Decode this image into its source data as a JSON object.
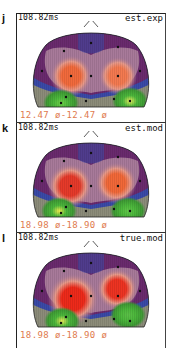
{
  "figure": {
    "panels": [
      {
        "letter": "j",
        "time": "108.82ms",
        "label": "est.exp",
        "scale": "12.47 ø-12.47 ø",
        "maxima": [
          {
            "x": 45,
            "y": 55,
            "color": "#f26a3c",
            "r": 13
          },
          {
            "x": 92,
            "y": 55,
            "color": "#f47a50",
            "r": 12
          }
        ],
        "greens": [
          {
            "x": 35,
            "y": 82,
            "highlight": "#6fd24a"
          },
          {
            "x": 104,
            "y": 80,
            "highlight": "#e8f060"
          }
        ]
      },
      {
        "letter": "k",
        "time": "108.82ms",
        "label": "est.mod",
        "scale": "18.98 ø-18.90 ø",
        "maxima": [
          {
            "x": 44,
            "y": 55,
            "color": "#e63a2a",
            "r": 14
          },
          {
            "x": 90,
            "y": 52,
            "color": "#f26838",
            "r": 13
          }
        ],
        "greens": [
          {
            "x": 33,
            "y": 80,
            "highlight": "#f0f050"
          },
          {
            "x": 102,
            "y": 80,
            "highlight": "#62c84a"
          }
        ]
      },
      {
        "letter": "l",
        "time": "108.82ms",
        "label": "true.mod",
        "scale": "18.98 ø-18.90 ø",
        "maxima": [
          {
            "x": 47,
            "y": 58,
            "color": "#ee2a1a",
            "r": 16
          },
          {
            "x": 91,
            "y": 48,
            "color": "#ee3322",
            "r": 13
          }
        ],
        "greens": [
          {
            "x": 36,
            "y": 80,
            "highlight": "#e8ec58"
          },
          {
            "x": 102,
            "y": 74,
            "highlight": "#5cc048"
          }
        ]
      }
    ],
    "colors": {
      "frame": "#222222",
      "scale_text": "#e07a4e",
      "head_purple": "#6a2a6e",
      "head_blue": "#3a4aa8",
      "head_mauve": "#a87a9a",
      "head_gray": "#8c8c7a",
      "head_green": "#3e9a34"
    }
  }
}
